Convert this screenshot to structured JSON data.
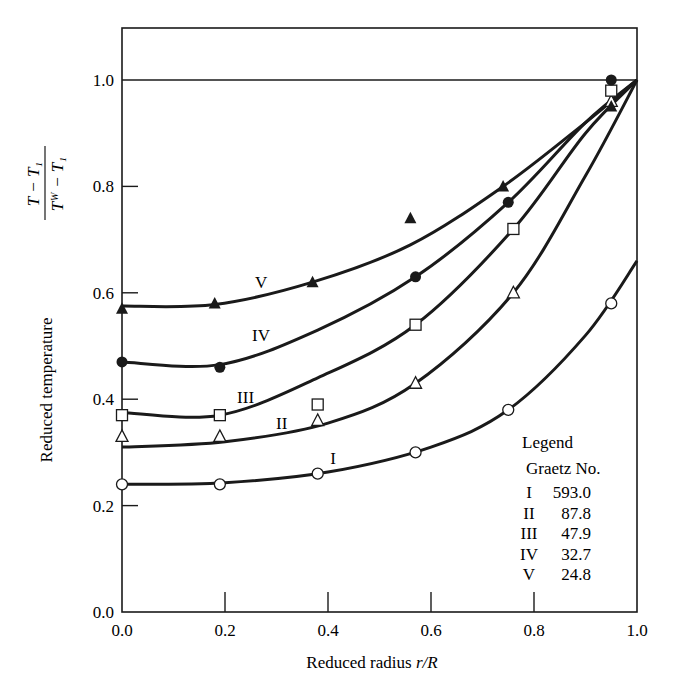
{
  "chart_data": {
    "type": "line",
    "title": "",
    "xlabel": "Reduced radius r/R",
    "xlabel_parts": {
      "text": "Reduced radius ",
      "italic": "r/R"
    },
    "ylabel": "Reduced temperature (T - T1)/(Tw - T1)",
    "ylabel_parts": {
      "text": "Reduced temperature",
      "numerator": "T − T₁",
      "denominator": "Tᵂ − T₁"
    },
    "xlim": [
      0.0,
      1.0
    ],
    "ylim": [
      0.0,
      1.1
    ],
    "x_ticks": [
      "0.0",
      "0.2",
      "0.4",
      "0.6",
      "0.8",
      "1.0"
    ],
    "y_ticks": [
      "0.0",
      "0.2",
      "0.4",
      "0.6",
      "0.8",
      "1.0"
    ],
    "grid": false,
    "reference_line": {
      "y": 1.0
    },
    "legend": {
      "title": "Legend",
      "subtitle": "Graetz No.",
      "position": "lower right inside",
      "entries": [
        {
          "label": "I",
          "value": "593.0"
        },
        {
          "label": "II",
          "value": "87.8"
        },
        {
          "label": "III",
          "value": "47.9"
        },
        {
          "label": "IV",
          "value": "32.7"
        },
        {
          "label": "V",
          "value": "24.8"
        }
      ]
    },
    "series": [
      {
        "name": "I",
        "graetz": 593.0,
        "marker": "open-circle",
        "points": [
          [
            0.0,
            0.24
          ],
          [
            0.19,
            0.24
          ],
          [
            0.38,
            0.26
          ],
          [
            0.57,
            0.3
          ],
          [
            0.75,
            0.38
          ],
          [
            0.95,
            0.58
          ]
        ],
        "curve": [
          [
            0.0,
            0.24
          ],
          [
            0.2,
            0.243
          ],
          [
            0.4,
            0.263
          ],
          [
            0.6,
            0.31
          ],
          [
            0.75,
            0.38
          ],
          [
            0.9,
            0.52
          ],
          [
            1.0,
            0.66
          ]
        ],
        "label_at": [
          0.41,
          0.29
        ]
      },
      {
        "name": "II",
        "graetz": 87.8,
        "marker": "open-triangle",
        "points": [
          [
            0.0,
            0.33
          ],
          [
            0.19,
            0.33
          ],
          [
            0.38,
            0.36
          ],
          [
            0.57,
            0.43
          ],
          [
            0.76,
            0.6
          ],
          [
            0.95,
            0.96
          ]
        ],
        "curve": [
          [
            0.0,
            0.31
          ],
          [
            0.2,
            0.32
          ],
          [
            0.4,
            0.355
          ],
          [
            0.57,
            0.43
          ],
          [
            0.76,
            0.6
          ],
          [
            0.9,
            0.82
          ],
          [
            1.0,
            1.0
          ]
        ],
        "label_at": [
          0.31,
          0.355
        ]
      },
      {
        "name": "III",
        "graetz": 47.9,
        "marker": "open-square",
        "points": [
          [
            0.0,
            0.37
          ],
          [
            0.19,
            0.37
          ],
          [
            0.38,
            0.39
          ],
          [
            0.57,
            0.54
          ],
          [
            0.76,
            0.72
          ],
          [
            0.95,
            0.98
          ]
        ],
        "curve": [
          [
            0.0,
            0.375
          ],
          [
            0.19,
            0.37
          ],
          [
            0.38,
            0.44
          ],
          [
            0.57,
            0.54
          ],
          [
            0.76,
            0.72
          ],
          [
            0.9,
            0.9
          ],
          [
            1.0,
            1.0
          ]
        ],
        "label_at": [
          0.24,
          0.405
        ]
      },
      {
        "name": "IV",
        "graetz": 32.7,
        "marker": "filled-circle",
        "points": [
          [
            0.0,
            0.47
          ],
          [
            0.19,
            0.46
          ],
          [
            0.57,
            0.63
          ],
          [
            0.75,
            0.77
          ],
          [
            0.95,
            1.0
          ]
        ],
        "curve": [
          [
            0.0,
            0.47
          ],
          [
            0.19,
            0.465
          ],
          [
            0.38,
            0.53
          ],
          [
            0.57,
            0.63
          ],
          [
            0.75,
            0.77
          ],
          [
            0.9,
            0.92
          ],
          [
            1.0,
            1.0
          ]
        ],
        "label_at": [
          0.27,
          0.52
        ]
      },
      {
        "name": "V",
        "graetz": 24.8,
        "marker": "filled-triangle",
        "points": [
          [
            0.0,
            0.57
          ],
          [
            0.18,
            0.58
          ],
          [
            0.37,
            0.62
          ],
          [
            0.56,
            0.74
          ],
          [
            0.74,
            0.8
          ],
          [
            0.95,
            0.95
          ]
        ],
        "curve": [
          [
            0.0,
            0.575
          ],
          [
            0.18,
            0.578
          ],
          [
            0.37,
            0.62
          ],
          [
            0.56,
            0.69
          ],
          [
            0.74,
            0.8
          ],
          [
            0.9,
            0.92
          ],
          [
            1.0,
            1.0
          ]
        ],
        "label_at": [
          0.27,
          0.62
        ]
      }
    ]
  }
}
